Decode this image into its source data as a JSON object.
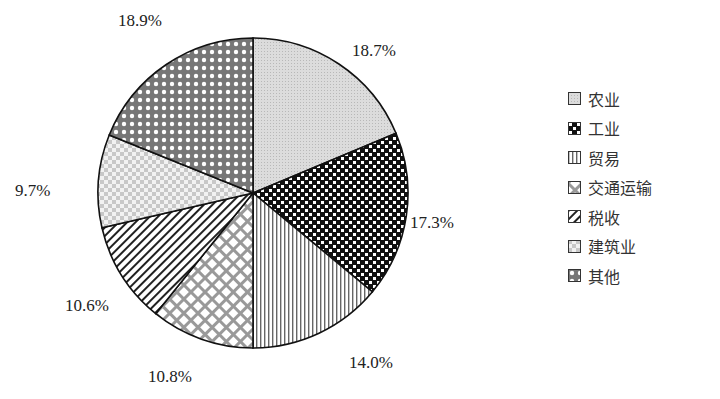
{
  "chart_data": {
    "type": "pie",
    "title": "",
    "categories": [
      "农业",
      "工业",
      "贸易",
      "交通运输",
      "税收",
      "建筑业",
      "其他"
    ],
    "values": [
      18.7,
      17.3,
      14.0,
      10.8,
      10.6,
      9.7,
      18.9
    ],
    "labels": [
      "18.7%",
      "17.3%",
      "14.0%",
      "10.8%",
      "10.6%",
      "9.7%",
      "18.9%"
    ],
    "start_angle": "12 o'clock",
    "direction": "clockwise",
    "legend_position": "right"
  },
  "legend": {
    "items": [
      {
        "label": "农业",
        "pattern": "light-gray-dots"
      },
      {
        "label": "工业",
        "pattern": "black-checker"
      },
      {
        "label": "贸易",
        "pattern": "vertical-lines"
      },
      {
        "label": "交通运输",
        "pattern": "diagonal-crosshatch"
      },
      {
        "label": "税收",
        "pattern": "diagonal-lines"
      },
      {
        "label": "建筑业",
        "pattern": "light-checker"
      },
      {
        "label": "其他",
        "pattern": "dark-diamond-grid"
      }
    ]
  }
}
